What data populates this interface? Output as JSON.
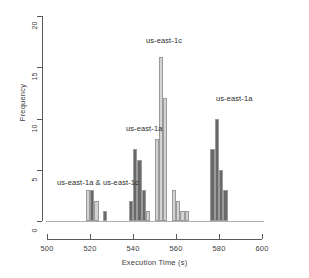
{
  "chart_data": {
    "type": "bar",
    "title": "",
    "xlabel": "Execution Time (s)",
    "ylabel": "Frequency",
    "xlim": [
      500,
      600
    ],
    "ylim": [
      0,
      20
    ],
    "xticks": [
      500,
      520,
      540,
      560,
      580,
      600
    ],
    "yticks": [
      0,
      5,
      10,
      15,
      20
    ],
    "grid": false,
    "legend": "none",
    "bin_width": 2,
    "colors": {
      "us-east-1c": "#d3d3d3",
      "us-east-1a": "#696969",
      "bar_border": "#9a9a9a",
      "axis": "#595959",
      "text": "#2e2e2e"
    },
    "series": [
      {
        "name": "us-east-1c",
        "color": "#d3d3d3",
        "bins": [
          {
            "x": 518,
            "value": 3
          },
          {
            "x": 522,
            "value": 2
          },
          {
            "x": 546,
            "value": 1
          },
          {
            "x": 550,
            "value": 8
          },
          {
            "x": 552,
            "value": 16
          },
          {
            "x": 554,
            "value": 12
          },
          {
            "x": 558,
            "value": 3
          },
          {
            "x": 560,
            "value": 2
          },
          {
            "x": 562,
            "value": 1
          },
          {
            "x": 564,
            "value": 1
          }
        ]
      },
      {
        "name": "us-east-1a",
        "color": "#696969",
        "bins": [
          {
            "x": 520,
            "value": 3
          },
          {
            "x": 526,
            "value": 1
          },
          {
            "x": 538,
            "value": 2
          },
          {
            "x": 540,
            "value": 7
          },
          {
            "x": 542,
            "value": 6
          },
          {
            "x": 544,
            "value": 3
          },
          {
            "x": 576,
            "value": 7
          },
          {
            "x": 578,
            "value": 10
          },
          {
            "x": 580,
            "value": 5
          },
          {
            "x": 582,
            "value": 3
          }
        ]
      }
    ],
    "annotations": [
      {
        "text": "us-east-1a & us-east-1c",
        "x": 57,
        "y": 178
      },
      {
        "text": "us-east-1a",
        "x": 126,
        "y": 124
      },
      {
        "text": "us-east-1c",
        "x": 146,
        "y": 36
      },
      {
        "text": "us-east-1a",
        "x": 216,
        "y": 94
      }
    ]
  },
  "axis": {
    "y_title": "Frequency",
    "x_title": "Execution Time (s)",
    "y_labels": [
      "0",
      "5",
      "10",
      "15",
      "20"
    ],
    "x_labels": [
      "500",
      "520",
      "540",
      "560",
      "580",
      "600"
    ]
  }
}
